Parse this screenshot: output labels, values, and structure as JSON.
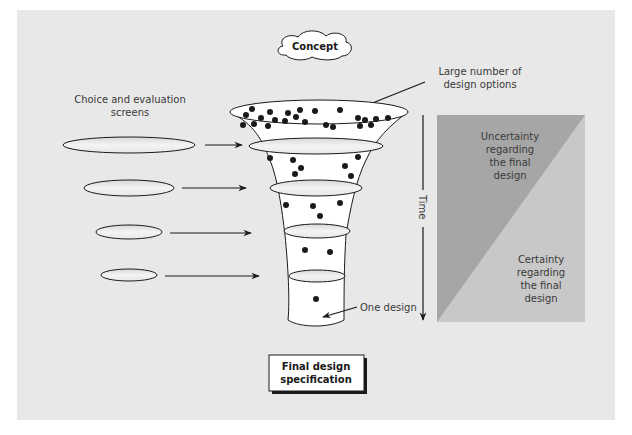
{
  "diagram": {
    "type": "funnel",
    "background_color": "#e8e8e8",
    "concept_label": "Concept",
    "top_annotation": [
      "Large number of",
      "design options"
    ],
    "screens_label": [
      "Choice and evaluation",
      "screens"
    ],
    "bottom_annotation": "One design",
    "final_label": [
      "Final design",
      "specification"
    ],
    "time_label": "Time",
    "uncertainty_label": [
      "Uncertainty",
      "regarding",
      "the final",
      "design"
    ],
    "certainty_label": [
      "Certainty",
      "regarding",
      "the final",
      "design"
    ],
    "colors": {
      "uncertainty": "#a6a6a6",
      "certainty": "#c8c8c8",
      "funnel_fill": "#ffffff",
      "stroke": "#1a1a1a"
    },
    "stages": [
      {
        "name": "screen-1",
        "dots": 33
      },
      {
        "name": "screen-2",
        "dots": 7
      },
      {
        "name": "screen-3",
        "dots": 4
      },
      {
        "name": "screen-4",
        "dots": 2
      },
      {
        "name": "final",
        "dots": 1
      }
    ]
  }
}
